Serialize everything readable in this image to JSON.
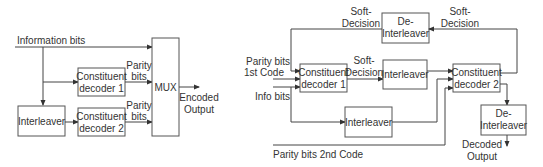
{
  "encoder": {
    "input_label": "Information bits",
    "interleaver": "Interleaver",
    "decoder1": [
      "Constituent",
      "decoder 1"
    ],
    "decoder2": [
      "Constituent",
      "decoder 2"
    ],
    "parity1": [
      "Parity",
      "bits"
    ],
    "parity2": [
      "Parity",
      "bits"
    ],
    "mux": "MUX",
    "output": [
      "Encoded",
      "Output"
    ]
  },
  "decoder": {
    "feedback_left": [
      "Soft-",
      "Decision"
    ],
    "feedback_right": [
      "Soft-",
      "Decision"
    ],
    "deinterleaver_top": [
      "De-",
      "Interleaver"
    ],
    "parity_1st": [
      "Parity bits",
      "1st Code"
    ],
    "info_bits": "Info bits",
    "decoder1": [
      "Constituent",
      "decoder 1"
    ],
    "soft_mid": [
      "Soft-",
      "Decision"
    ],
    "interleaver_mid": "Interleaver",
    "decoder2": [
      "Constituent",
      "decoder 2"
    ],
    "interleaver_bottom": "Interleaver",
    "deinterleaver_bottom": [
      "De-",
      "Interleaver"
    ],
    "parity_2nd": "Parity bits 2nd Code",
    "output": [
      "Decoded",
      "Output"
    ]
  }
}
